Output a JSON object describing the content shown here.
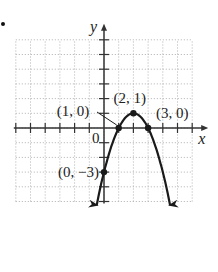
{
  "chart_data": {
    "type": "line",
    "title": "",
    "function": "y = -x^2 + 4x - 3",
    "xlabel": "x",
    "ylabel": "y",
    "xlim": [
      -6,
      6
    ],
    "ylim": [
      -5,
      6
    ],
    "grid": true,
    "origin_label": "0",
    "points": [
      {
        "x": 1,
        "y": 0,
        "label": "(1, 0)"
      },
      {
        "x": 2,
        "y": 1,
        "label": "(2, 1)"
      },
      {
        "x": 3,
        "y": 0,
        "label": "(3, 0)"
      },
      {
        "x": 0,
        "y": -3,
        "label": "(0, −3)"
      }
    ],
    "curve_x_range": [
      -0.5,
      4.5
    ],
    "curve_arrows": "both ends pointing down"
  },
  "colors": {
    "curve": "#1a1a1a",
    "grid": "#b0b0b0",
    "axis": "#333333"
  }
}
